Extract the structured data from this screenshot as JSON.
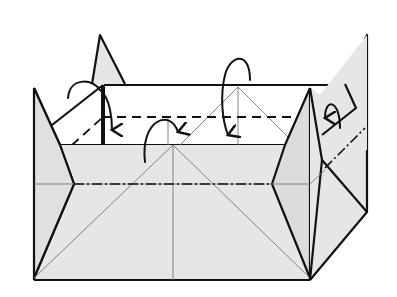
{
  "diagram": {
    "type": "origami-fold-diagram",
    "colors": {
      "paper": "#e6e6e6",
      "paper_inside": "#ffffff",
      "line": "#111111",
      "crease": "#777777"
    },
    "symbols": [
      {
        "name": "valley-fold-line",
        "style": "dashed",
        "location": "inner back wall"
      },
      {
        "name": "mountain-fold-line",
        "style": "dash-dot",
        "location": "front wall horizontal and right wall diagonal"
      },
      {
        "name": "fold-arrow",
        "count": 5,
        "direction": "fold inward / over the edge"
      }
    ],
    "text_labels": []
  }
}
